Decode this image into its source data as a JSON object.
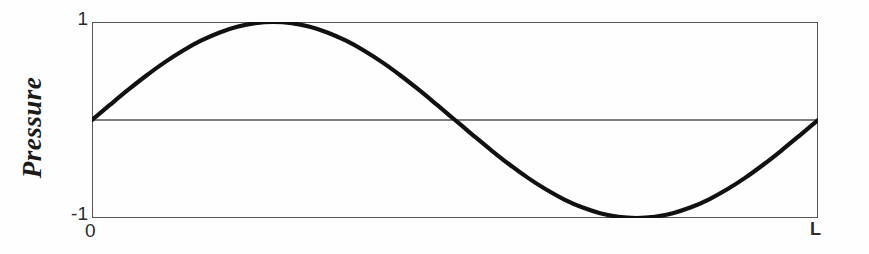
{
  "figure": {
    "background_color": "#fefefe",
    "frame_color": "#555555",
    "curve_color": "#111111"
  },
  "axes": {
    "y_axis_title": "Pressure",
    "y_tick_max_label": "1",
    "y_tick_min_label": "-1",
    "x_tick_start_label": "0",
    "x_tick_end_label": "L"
  },
  "chart_data": {
    "type": "line",
    "title": "",
    "subtitle": "",
    "xlabel": "",
    "ylabel": "Pressure",
    "xlim": [
      0,
      1
    ],
    "ylim": [
      -1,
      1
    ],
    "xtick_labels": [
      "0",
      "L"
    ],
    "xtick_values": [
      0,
      1
    ],
    "ytick_labels": [
      "1",
      "-1"
    ],
    "ytick_values": [
      1,
      -1
    ],
    "grid": false,
    "legend": false,
    "legend_position": "none",
    "zero_line": true,
    "annotations": [
      {
        "label": "antinode (maximum pressure)",
        "x": 0.25,
        "y": 1
      },
      {
        "label": "node (zero pressure)",
        "x": 0.5,
        "y": 0
      },
      {
        "label": "antinode (minimum pressure)",
        "x": 0.75,
        "y": -1
      }
    ],
    "series": [
      {
        "name": "Pressure",
        "function": "sin(2*pi*x/L)",
        "amplitude": 1,
        "cycles": 1,
        "x": [
          0,
          0.025,
          0.05,
          0.075,
          0.1,
          0.125,
          0.15,
          0.175,
          0.2,
          0.225,
          0.25,
          0.275,
          0.3,
          0.325,
          0.35,
          0.375,
          0.4,
          0.425,
          0.45,
          0.475,
          0.5,
          0.525,
          0.55,
          0.575,
          0.6,
          0.625,
          0.65,
          0.675,
          0.7,
          0.725,
          0.75,
          0.775,
          0.8,
          0.825,
          0.85,
          0.875,
          0.9,
          0.925,
          0.95,
          0.975,
          1
        ],
        "values": [
          0,
          0.156,
          0.309,
          0.454,
          0.588,
          0.707,
          0.809,
          0.891,
          0.951,
          0.988,
          1,
          0.988,
          0.951,
          0.891,
          0.809,
          0.707,
          0.588,
          0.454,
          0.309,
          0.156,
          0,
          -0.156,
          -0.309,
          -0.454,
          -0.588,
          -0.707,
          -0.809,
          -0.891,
          -0.951,
          -0.988,
          -1,
          -0.988,
          -0.951,
          -0.891,
          -0.809,
          -0.707,
          -0.588,
          -0.454,
          -0.309,
          -0.156,
          0
        ]
      }
    ]
  }
}
